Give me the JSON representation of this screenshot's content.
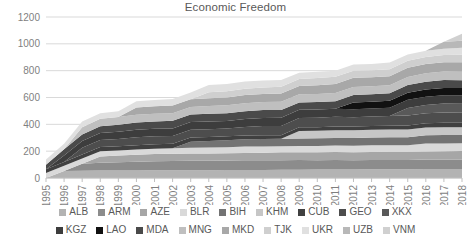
{
  "chart_data": {
    "type": "area",
    "stacked": true,
    "title": "Economic Freedom",
    "xlabel": "",
    "ylabel": "",
    "ylim": [
      0,
      1200
    ],
    "yticks": [
      0,
      200,
      400,
      600,
      800,
      1000,
      1200
    ],
    "grid": true,
    "legend_position": "bottom",
    "x": [
      1995,
      1996,
      1997,
      1998,
      1999,
      2000,
      2001,
      2002,
      2003,
      2004,
      2005,
      2006,
      2007,
      2008,
      2009,
      2010,
      2011,
      2012,
      2013,
      2014,
      2015,
      2016,
      2017,
      2018
    ],
    "categories": [
      "1995",
      "1996",
      "1997",
      "1998",
      "1999",
      "2000",
      "2001",
      "2002",
      "2003",
      "2004",
      "2005",
      "2006",
      "2007",
      "2008",
      "2009",
      "2010",
      "2011",
      "2012",
      "2013",
      "2014",
      "2015",
      "2016",
      "2017",
      "2018"
    ],
    "series": [
      {
        "name": "ALB",
        "color": "#b3b3b3",
        "values": [
          0,
          52,
          54,
          55,
          55,
          56,
          57,
          57,
          58,
          58,
          59,
          60,
          60,
          61,
          62,
          63,
          64,
          64,
          65,
          65,
          66,
          67,
          68,
          68
        ]
      },
      {
        "name": "ARM",
        "color": "#8c8c8c",
        "values": [
          0,
          0,
          52,
          58,
          62,
          66,
          68,
          69,
          70,
          71,
          71,
          72,
          72,
          72,
          72,
          70,
          70,
          69,
          69,
          69,
          69,
          70,
          70,
          70
        ]
      },
      {
        "name": "AZE",
        "color": "#a6a6a6",
        "values": [
          0,
          0,
          0,
          48,
          50,
          52,
          54,
          55,
          55,
          54,
          54,
          55,
          56,
          58,
          58,
          58,
          59,
          59,
          60,
          61,
          61,
          61,
          62,
          63
        ]
      },
      {
        "name": "BLR",
        "color": "#d9d9d9",
        "values": [
          38,
          40,
          40,
          39,
          38,
          38,
          39,
          40,
          42,
          44,
          46,
          47,
          47,
          45,
          46,
          48,
          49,
          49,
          50,
          50,
          48,
          59,
          58,
          58
        ]
      },
      {
        "name": "BIH",
        "color": "#737373",
        "values": [
          0,
          0,
          0,
          0,
          0,
          0,
          0,
          0,
          45,
          48,
          52,
          54,
          55,
          56,
          57,
          57,
          57,
          57,
          58,
          59,
          60,
          61,
          62,
          62
        ]
      },
      {
        "name": "KHM",
        "color": "#c6c6c6",
        "values": [
          0,
          0,
          0,
          0,
          0,
          0,
          0,
          0,
          0,
          0,
          0,
          0,
          0,
          0,
          56,
          57,
          57,
          57,
          57,
          57,
          58,
          58,
          59,
          58
        ]
      },
      {
        "name": "CUB",
        "color": "#404040",
        "values": [
          27,
          28,
          30,
          31,
          32,
          33,
          34,
          34,
          32,
          30,
          29,
          29,
          28,
          27,
          27,
          26,
          28,
          28,
          28,
          29,
          30,
          33,
          33,
          32
        ]
      },
      {
        "name": "GEO",
        "color": "#4d4d4d",
        "values": [
          0,
          0,
          50,
          53,
          54,
          58,
          59,
          58,
          58,
          58,
          58,
          64,
          69,
          69,
          69,
          70,
          72,
          69,
          72,
          73,
          73,
          73,
          76,
          76
        ]
      },
      {
        "name": "XKX",
        "color": "#595959",
        "values": [
          0,
          0,
          0,
          0,
          0,
          0,
          0,
          0,
          0,
          0,
          0,
          0,
          0,
          0,
          0,
          0,
          0,
          0,
          0,
          0,
          56,
          62,
          67,
          67
        ]
      },
      {
        "name": "KGZ",
        "color": "#3d3d3d",
        "values": [
          0,
          48,
          50,
          52,
          54,
          56,
          56,
          56,
          57,
          58,
          56,
          59,
          60,
          61,
          61,
          62,
          61,
          60,
          59,
          61,
          62,
          62,
          62,
          62
        ]
      },
      {
        "name": "LAO",
        "color": "#111111",
        "values": [
          0,
          0,
          0,
          0,
          0,
          0,
          0,
          0,
          0,
          0,
          0,
          0,
          0,
          0,
          0,
          0,
          0,
          51,
          51,
          51,
          53,
          54,
          54,
          54
        ]
      },
      {
        "name": "MDA",
        "color": "#4a4a4a",
        "values": [
          33,
          47,
          48,
          50,
          51,
          54,
          54,
          57,
          57,
          58,
          58,
          58,
          59,
          58,
          54,
          55,
          55,
          55,
          55,
          57,
          58,
          58,
          59,
          59
        ]
      },
      {
        "name": "MNG",
        "color": "#bfbfbf",
        "values": [
          0,
          0,
          54,
          56,
          58,
          58,
          57,
          57,
          56,
          57,
          59,
          60,
          60,
          62,
          62,
          60,
          61,
          61,
          59,
          59,
          59,
          63,
          63,
          63
        ]
      },
      {
        "name": "MKD",
        "color": "#a8a8a8",
        "values": [
          0,
          0,
          0,
          0,
          0,
          54,
          56,
          57,
          57,
          58,
          58,
          60,
          61,
          61,
          61,
          66,
          68,
          68,
          68,
          67,
          68,
          68,
          69,
          70
        ]
      },
      {
        "name": "TJK",
        "color": "#cfcfcf",
        "values": [
          0,
          0,
          0,
          0,
          0,
          0,
          0,
          0,
          0,
          45,
          46,
          47,
          48,
          50,
          52,
          53,
          53,
          53,
          53,
          53,
          53,
          53,
          54,
          56
        ]
      },
      {
        "name": "UKR",
        "color": "#e0e0e0",
        "values": [
          39,
          40,
          43,
          40,
          43,
          47,
          48,
          48,
          51,
          54,
          55,
          54,
          51,
          51,
          48,
          46,
          45,
          46,
          46,
          49,
          46,
          46,
          48,
          52
        ]
      },
      {
        "name": "UZB",
        "color": "#b8b8b8",
        "values": [
          0,
          0,
          0,
          0,
          0,
          0,
          0,
          0,
          0,
          0,
          0,
          0,
          0,
          0,
          0,
          0,
          0,
          0,
          0,
          0,
          0,
          0,
          52,
          53
        ]
      },
      {
        "name": "VNM",
        "color": "#d0d0d0",
        "values": [
          0,
          0,
          0,
          0,
          0,
          0,
          0,
          0,
          0,
          0,
          0,
          0,
          0,
          0,
          0,
          0,
          0,
          0,
          0,
          0,
          0,
          0,
          0,
          53
        ]
      }
    ]
  },
  "legend": {
    "row1": [
      "ALB",
      "ARM",
      "AZE",
      "BLR",
      "BIH",
      "KHM",
      "CUB",
      "GEO",
      "XKX"
    ],
    "row2": [
      "KGZ",
      "LAO",
      "MDA",
      "MNG",
      "MKD",
      "TJK",
      "UKR",
      "UZB",
      "VNM"
    ]
  },
  "colors": {
    "gridline": "#d9d9d9",
    "tick_text": "#7f7f7f",
    "title_text": "#595959"
  }
}
